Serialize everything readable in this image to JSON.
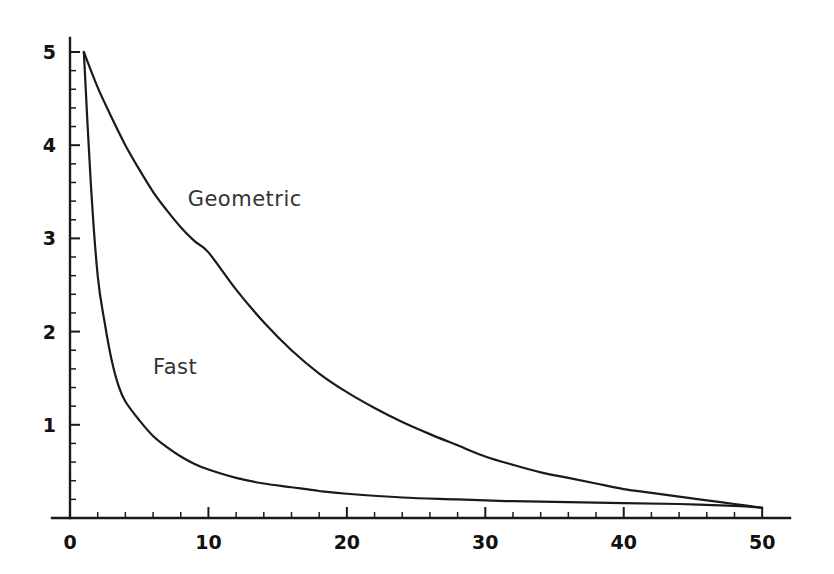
{
  "chart_data": {
    "type": "line",
    "title": "",
    "xlabel": "",
    "ylabel": "",
    "xlim": [
      0,
      51
    ],
    "ylim": [
      0,
      5.15
    ],
    "grid": false,
    "legend_position": "inline-annotation",
    "x_ticks_major": [
      0,
      10,
      20,
      30,
      40,
      50
    ],
    "x_tick_labels": [
      "0",
      "10",
      "20",
      "30",
      "40",
      "50"
    ],
    "x_tick_minor_step": 2,
    "y_ticks_major": [
      1,
      2,
      3,
      4,
      5
    ],
    "y_tick_labels": [
      "1",
      "2",
      "3",
      "4",
      "5"
    ],
    "y_tick_minor_step": 0.2,
    "annotations": [
      {
        "text": "Geometric",
        "x": 8.5,
        "y": 3.35
      },
      {
        "text": "Fast",
        "x": 6.0,
        "y": 1.55
      }
    ],
    "series": [
      {
        "name": "Geometric",
        "color": "#1a1a1a",
        "x": [
          1,
          2,
          3,
          4,
          5,
          6,
          7,
          8,
          9,
          10,
          12,
          14,
          16,
          18,
          20,
          22,
          24,
          26,
          28,
          30,
          32,
          34,
          36,
          38,
          40,
          42,
          44,
          46,
          48,
          50
        ],
        "values": [
          5.0,
          4.62,
          4.3,
          4.0,
          3.74,
          3.5,
          3.3,
          3.12,
          2.97,
          2.85,
          2.45,
          2.1,
          1.8,
          1.55,
          1.35,
          1.18,
          1.03,
          0.9,
          0.78,
          0.66,
          0.57,
          0.49,
          0.43,
          0.37,
          0.31,
          0.27,
          0.23,
          0.19,
          0.15,
          0.11
        ]
      },
      {
        "name": "Fast",
        "color": "#1a1a1a",
        "x": [
          1,
          1.5,
          2,
          2.5,
          3,
          3.5,
          4,
          5,
          6,
          7,
          8,
          9,
          10,
          12,
          14,
          16,
          18,
          20,
          24,
          28,
          32,
          36,
          40,
          44,
          48,
          50
        ],
        "values": [
          5.0,
          3.6,
          2.6,
          2.1,
          1.7,
          1.42,
          1.25,
          1.05,
          0.88,
          0.76,
          0.66,
          0.58,
          0.52,
          0.43,
          0.37,
          0.33,
          0.29,
          0.26,
          0.22,
          0.2,
          0.18,
          0.17,
          0.16,
          0.15,
          0.13,
          0.11
        ]
      }
    ]
  },
  "geometry": {
    "plot_left": 70,
    "plot_right": 776,
    "plot_bottom": 518,
    "plot_top": 38,
    "axis_overshoot_left": 18,
    "axis_overshoot_right": 14
  }
}
